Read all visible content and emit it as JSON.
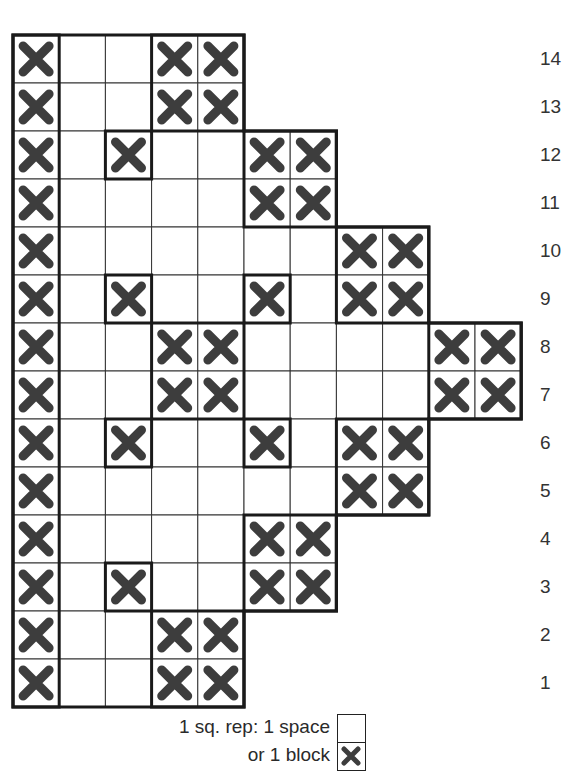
{
  "chart_data": {
    "type": "knitting-chart-grid",
    "title": "",
    "columns": 11,
    "rows": 14,
    "row_labels_top_to_bottom": [
      "14",
      "13",
      "12",
      "11",
      "10",
      "9",
      "8",
      "7",
      "6",
      "5",
      "4",
      "3",
      "2",
      "1"
    ],
    "symbols": {
      ".": "space (empty)",
      "X": "block (cross)",
      "-": "outside pattern"
    },
    "grid_top_to_bottom": [
      "X..XX------",
      "X..XX------",
      "X.X..XX----",
      "X....XX----",
      "X......XX--",
      "X.X..X.XX--",
      "X..XX....XX",
      "X..XX....XX",
      "X.X..X.XX--",
      "X......XX--",
      "X....XX----",
      "X.X..XX----",
      "X..XX------",
      "X..XX------"
    ],
    "thick_boxes": [
      {
        "c": 0,
        "r": 0,
        "w": 1,
        "h": 14
      },
      {
        "c": 3,
        "r": 0,
        "w": 2,
        "h": 2
      },
      {
        "c": 2,
        "r": 2,
        "w": 1,
        "h": 1
      },
      {
        "c": 5,
        "r": 2,
        "w": 2,
        "h": 2
      },
      {
        "c": 7,
        "r": 4,
        "w": 2,
        "h": 2
      },
      {
        "c": 2,
        "r": 5,
        "w": 1,
        "h": 1
      },
      {
        "c": 5,
        "r": 5,
        "w": 1,
        "h": 1
      },
      {
        "c": 3,
        "r": 6,
        "w": 2,
        "h": 2
      },
      {
        "c": 9,
        "r": 6,
        "w": 2,
        "h": 2
      },
      {
        "c": 2,
        "r": 8,
        "w": 1,
        "h": 1
      },
      {
        "c": 5,
        "r": 8,
        "w": 1,
        "h": 1
      },
      {
        "c": 7,
        "r": 8,
        "w": 2,
        "h": 2
      },
      {
        "c": 5,
        "r": 10,
        "w": 2,
        "h": 2
      },
      {
        "c": 2,
        "r": 11,
        "w": 1,
        "h": 1
      },
      {
        "c": 3,
        "r": 12,
        "w": 2,
        "h": 2
      }
    ],
    "outline": [
      [
        0,
        0
      ],
      [
        5,
        0
      ],
      [
        5,
        2
      ],
      [
        7,
        2
      ],
      [
        7,
        4
      ],
      [
        9,
        4
      ],
      [
        9,
        6
      ],
      [
        11,
        6
      ],
      [
        11,
        8
      ],
      [
        9,
        8
      ],
      [
        9,
        10
      ],
      [
        7,
        10
      ],
      [
        7,
        12
      ],
      [
        5,
        12
      ],
      [
        5,
        14
      ],
      [
        0,
        14
      ]
    ],
    "legend": [
      {
        "label": "1 sq. rep: 1 space",
        "symbol": "space"
      },
      {
        "label": "or 1 block",
        "symbol": "block"
      }
    ],
    "colors": {
      "grid_line": "#333333",
      "cross": "#3d3d3d",
      "background": "#ffffff"
    }
  },
  "legend": {
    "line1": "1 sq. rep: 1 space",
    "line2": "or 1 block"
  }
}
